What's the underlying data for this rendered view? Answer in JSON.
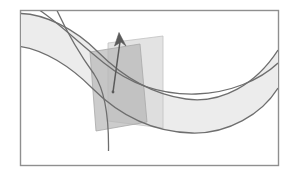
{
  "figure": {
    "title": "Normal vector and normal plane on a curved surface",
    "kind": "geometry-diagram",
    "canvas": {
      "width": 296,
      "height": 173
    },
    "frame": {
      "label": "figure-border",
      "x": 20.5,
      "y": 10.5,
      "width": 258,
      "height": 155,
      "stroke": "#8f8f8f",
      "stroke_width": 1.4,
      "fill": "#ffffff"
    },
    "colors": {
      "background": "#ffffff",
      "surface_fill": "#ececec",
      "surface_edge": "#7c7c7c",
      "curve_stroke": "#6e6e6e",
      "plane_light_fill": "#d6d6d6",
      "plane_dark_fill": "#b4b4b4",
      "plane_edge": "#b9b9b9",
      "vector_stroke": "#5a5a5a",
      "frame_stroke": "#8f8f8f"
    },
    "surface": {
      "name": "curved-band",
      "description": "Annular band sweeping from upper-left, dipping low at center, rising to the right edge",
      "fill": "#ececec",
      "outer_edge_path": "M 20.5 14 C 44 14 74 28 98 52 C 122 76 150 94 186 99 C 222 104 256 84 278 50",
      "inner_edge_path": "M 20.5 47 C 44 50 70 66 92 88 C 118 114 152 132 192 133 C 228 134 262 114 278 88",
      "band_fill_path": "M 20.5 14 C 44 14 74 28 98 52 C 122 76 150 94 186 99 C 222 104 256 84 278 50 L 278 88 C 262 114 228 134 192 133 C 152 132 118 114 92 88 C 70 66 44 50 20.5 47 Z"
    },
    "surface_curves": [
      {
        "name": "parameter-curve-upper",
        "description": "u-parameter curve running across the upper part of the band",
        "path": "M 20.5 13.5 C 44 14 74 28 98 52 C 122 76 150 94 186 99 C 222 104 256 84 278 50",
        "stroke": "#6e6e6e",
        "stroke_width": 1.3
      },
      {
        "name": "parameter-curve-middle",
        "description": "u-parameter curve through the tangency point",
        "path": "M 40 10.5 C 60 24 80 44 104 63 C 130 84 160 95 196 94 C 230 93 260 80 278 63",
        "stroke": "#6e6e6e",
        "stroke_width": 1.3
      },
      {
        "name": "parameter-curve-lower",
        "description": "lower boundary curve of the band",
        "path": "M 20.5 46.5 C 44 50 70 66 92 88 C 118 114 152 132 192 133 C 228 134 262 114 278 88",
        "stroke": "#6e6e6e",
        "stroke_width": 1.3
      },
      {
        "name": "parameter-curve-transverse",
        "description": "v-parameter curve crossing the band from top edge down to lower edge",
        "path": "M 57 10.5 C 66 30 78 52 94 74 C 104 89 109 115 108.5 151",
        "stroke": "#6e6e6e",
        "stroke_width": 1.3
      }
    ],
    "planes": [
      {
        "name": "tangent-plane-light",
        "description": "lighter translucent parallelogram, the rear/tangent plane",
        "points": "108,43 163,36 163,128 108,121",
        "fill": "#d8d8d8",
        "fill_opacity": 0.72,
        "stroke": "#c2c2c2",
        "stroke_width": 0.8
      },
      {
        "name": "normal-plane-dark",
        "description": "darker translucent parallelogram intersecting the first, the normal plane",
        "points": "90,52 140,44 147,122 96,131",
        "fill": "#b6b6b6",
        "fill_opacity": 0.7,
        "stroke": "#a8a8a8",
        "stroke_width": 0.8
      }
    ],
    "vector": {
      "name": "normal-vector-arrow",
      "description": "normal vector drawn from the surface point upward and to the left",
      "tail_x": 113,
      "tail_y": 92,
      "head_x": 119,
      "head_y": 33,
      "stroke": "#5a5a5a",
      "stroke_width": 1.5,
      "shaft_path": "M 113 92 L 120.5 38",
      "head_points": "119,32.5 114.5,46 121,42 126,46"
    },
    "base_point": {
      "name": "surface-tangency-point",
      "x": 113,
      "y": 92,
      "radius": 1.4,
      "fill": "#5a5a5a"
    }
  }
}
